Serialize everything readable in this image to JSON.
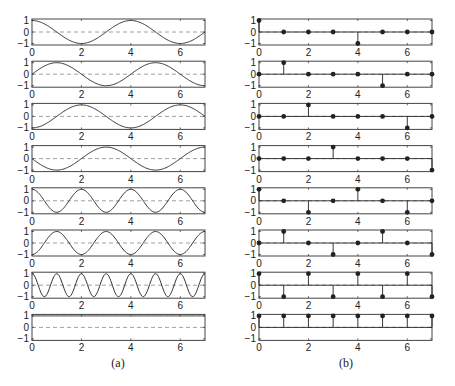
{
  "figure": {
    "panel_a_caption": "(a)",
    "panel_b_caption": "(b)"
  },
  "chart_data": [
    {
      "type": "line",
      "panel": "(a)",
      "title": "",
      "xlabel": "",
      "ylabel": "",
      "xlim": [
        0,
        7
      ],
      "ylim": [
        -1,
        1
      ],
      "xticks": [
        0,
        2,
        4,
        6
      ],
      "yticks": [
        -1,
        0,
        1
      ],
      "grid": false,
      "zero_line": "dashed",
      "subplots": [
        {
          "row": 1,
          "description": "cos(pi*t/4)",
          "freq": 0.25,
          "phase_shift": 0
        },
        {
          "row": 2,
          "description": "cos(pi*(t-1)/4)",
          "freq": 0.25,
          "phase_shift": 1
        },
        {
          "row": 3,
          "description": "cos(pi*(t-2)/4)",
          "freq": 0.25,
          "phase_shift": 2
        },
        {
          "row": 4,
          "description": "cos(pi*(t-3)/4)",
          "freq": 0.25,
          "phase_shift": 3
        },
        {
          "row": 5,
          "description": "cos(pi*t/2)",
          "freq": 0.5,
          "phase_shift": 0
        },
        {
          "row": 6,
          "description": "cos(pi*(t-1)/2)",
          "freq": 0.5,
          "phase_shift": 1
        },
        {
          "row": 7,
          "description": "cos(pi*t)",
          "freq": 1,
          "phase_shift": 0
        },
        {
          "row": 8,
          "description": "constant 1",
          "freq": 0,
          "phase_shift": 0
        }
      ]
    },
    {
      "type": "stem",
      "panel": "(b)",
      "title": "",
      "xlabel": "",
      "ylabel": "",
      "x": [
        0,
        1,
        2,
        3,
        4,
        5,
        6,
        7
      ],
      "xlim": [
        0,
        7
      ],
      "ylim": [
        -1,
        1
      ],
      "xticks": [
        0,
        2,
        4,
        6
      ],
      "yticks": [
        -1,
        0,
        1
      ],
      "grid": false,
      "series": [
        {
          "name": "row1",
          "values": [
            1,
            0,
            0,
            0,
            -1,
            0,
            0,
            0
          ]
        },
        {
          "name": "row2",
          "values": [
            0,
            1,
            0,
            0,
            0,
            -1,
            0,
            0
          ]
        },
        {
          "name": "row3",
          "values": [
            0,
            0,
            1,
            0,
            0,
            0,
            -1,
            0
          ]
        },
        {
          "name": "row4",
          "values": [
            0,
            0,
            0,
            1,
            0,
            0,
            0,
            -1
          ]
        },
        {
          "name": "row5",
          "values": [
            1,
            0,
            -1,
            0,
            1,
            0,
            -1,
            0
          ]
        },
        {
          "name": "row6",
          "values": [
            0,
            1,
            0,
            -1,
            0,
            1,
            0,
            -1
          ]
        },
        {
          "name": "row7",
          "values": [
            1,
            -1,
            1,
            -1,
            1,
            -1,
            1,
            -1
          ]
        },
        {
          "name": "row8",
          "values": [
            1,
            1,
            1,
            1,
            1,
            1,
            1,
            1
          ]
        }
      ]
    }
  ],
  "colors": {
    "curve": "#333333",
    "axes": "#444444",
    "zero_line": "#888888",
    "stem": "#222222",
    "text": "#222222"
  }
}
